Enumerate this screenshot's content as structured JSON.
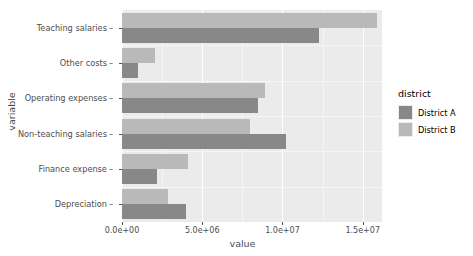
{
  "chart_data": {
    "type": "bar",
    "orientation": "horizontal",
    "title": "",
    "xlabel": "value",
    "ylabel": "variable",
    "categories": [
      "Teaching salaries",
      "Other costs",
      "Operating expenses",
      "Non-teaching salaries",
      "Finance expense",
      "Depreciation"
    ],
    "series": [
      {
        "name": "District A",
        "color": "#888888",
        "values": [
          12300000,
          1000000,
          8500000,
          10200000,
          2200000,
          4000000
        ]
      },
      {
        "name": "District B",
        "color": "#b9b9b9",
        "values": [
          15900000,
          2050000,
          8900000,
          7950000,
          4100000,
          2850000
        ]
      }
    ],
    "xlim": [
      0,
      16200000
    ],
    "x_ticks": [
      0,
      5000000,
      10000000,
      15000000
    ],
    "x_tick_labels": [
      "0.0e+00",
      "5.0e+06",
      "1.0e+07",
      "1.5e+07"
    ],
    "grid": true,
    "legend_position": "right"
  },
  "legend": {
    "title": "district",
    "entries": [
      {
        "label": "District A",
        "color": "#888888"
      },
      {
        "label": "District B",
        "color": "#b9b9b9"
      }
    ]
  },
  "axes": {
    "x_title": "value",
    "y_title": "variable"
  },
  "theme": {
    "panel_background": "#ebebeb",
    "grid_major": "#ffffff",
    "grid_minor": "#f5f5f5",
    "text_color": "#4d4d4d",
    "page_background": "#ffffff"
  }
}
